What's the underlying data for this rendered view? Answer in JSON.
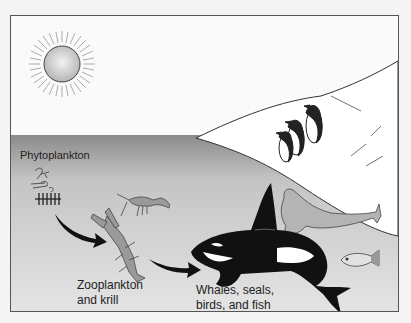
{
  "diagram": {
    "labels": {
      "phytoplankton": "Phytoplankton",
      "zooplankton_line1": "Zooplankton",
      "zooplankton_line2": "and krill",
      "predators_line1": "Whales, seals,",
      "predators_line2": "birds, and fish"
    },
    "elements": [
      "sun",
      "ice shelf",
      "penguins",
      "phytoplankton",
      "krill",
      "crayfish-like zooplankton",
      "orca whale",
      "seal",
      "fish",
      "arrows"
    ],
    "colors": {
      "sky": "#fafafa",
      "water_top": "#8a8a8a",
      "water_bottom": "#e6e6e6",
      "ice": "#ffffff",
      "border": "#555555"
    }
  }
}
